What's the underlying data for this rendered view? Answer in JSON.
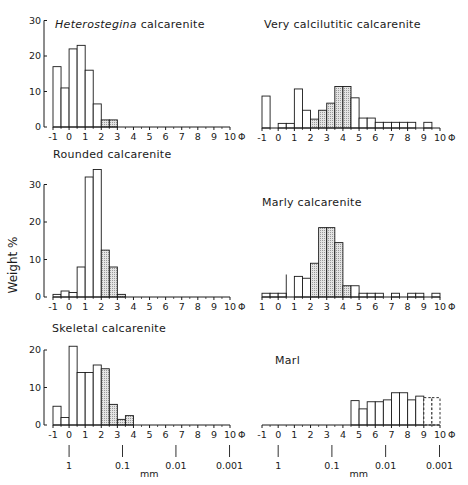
{
  "figure": {
    "ylabel": "Weight %",
    "phi_symbol": "Φ",
    "mm_label": "mm"
  },
  "chart_data": [
    {
      "type": "bar",
      "title": "Heterostegina calcarenite",
      "title_italic_word": "Heterostegina",
      "title_rest": " calcarenite",
      "xlabel": "Φ",
      "ylabel": "Weight %",
      "xticks": [
        "-1",
        "0",
        "1",
        "2",
        "3",
        "4",
        "5",
        "6",
        "7",
        "8",
        "9",
        "10"
      ],
      "yticks": [
        0,
        10,
        20,
        30
      ],
      "ylim": [
        0,
        30
      ],
      "bin_width": 0.5,
      "bins": [
        {
          "from": -1.0,
          "value": 17,
          "shaded": false
        },
        {
          "from": -0.5,
          "value": 11,
          "shaded": false
        },
        {
          "from": 0.0,
          "value": 22,
          "shaded": false
        },
        {
          "from": 0.5,
          "value": 23,
          "shaded": false
        },
        {
          "from": 1.0,
          "value": 16,
          "shaded": false
        },
        {
          "from": 1.5,
          "value": 6.5,
          "shaded": false
        },
        {
          "from": 2.0,
          "value": 2,
          "shaded": true
        },
        {
          "from": 2.5,
          "value": 2,
          "shaded": true
        }
      ]
    },
    {
      "type": "bar",
      "title": "Very calcilutitic calcarenite",
      "xlabel": "Φ",
      "xticks": [
        "-1",
        "0",
        "1",
        "2",
        "3",
        "4",
        "5",
        "6",
        "7",
        "8",
        "9",
        "10"
      ],
      "ylim": [
        0,
        30
      ],
      "bin_width": 0.5,
      "bins": [
        {
          "from": -1.0,
          "value": 9,
          "shaded": false
        },
        {
          "from": -0.5,
          "value": 0,
          "shaded": false
        },
        {
          "from": 0.0,
          "value": 1.3,
          "shaded": false
        },
        {
          "from": 0.5,
          "value": 1.3,
          "shaded": false
        },
        {
          "from": 1.0,
          "value": 11,
          "shaded": false
        },
        {
          "from": 1.5,
          "value": 5,
          "shaded": false
        },
        {
          "from": 2.0,
          "value": 2.5,
          "shaded": true
        },
        {
          "from": 2.5,
          "value": 5,
          "shaded": true
        },
        {
          "from": 3.0,
          "value": 7,
          "shaded": true
        },
        {
          "from": 3.5,
          "value": 11.7,
          "shaded": true
        },
        {
          "from": 4.0,
          "value": 11.7,
          "shaded": true
        },
        {
          "from": 4.5,
          "value": 8.5,
          "shaded": false
        },
        {
          "from": 5.0,
          "value": 2.8,
          "shaded": false
        },
        {
          "from": 5.5,
          "value": 2.8,
          "shaded": false
        },
        {
          "from": 6.0,
          "value": 1.6,
          "shaded": false
        },
        {
          "from": 6.5,
          "value": 1.6,
          "shaded": false
        },
        {
          "from": 7.0,
          "value": 1.6,
          "shaded": false
        },
        {
          "from": 7.5,
          "value": 1.6,
          "shaded": false
        },
        {
          "from": 8.0,
          "value": 1.6,
          "shaded": false
        },
        {
          "from": 8.5,
          "value": 0,
          "shaded": false
        },
        {
          "from": 9.0,
          "value": 1.6,
          "shaded": false
        }
      ]
    },
    {
      "type": "bar",
      "title": "Rounded calcarenite",
      "xlabel": "Φ",
      "xticks": [
        "-1",
        "0",
        "1",
        "2",
        "3",
        "4",
        "5",
        "6",
        "7",
        "8",
        "9",
        "10"
      ],
      "yticks": [
        0,
        10,
        20,
        30
      ],
      "ylim": [
        0,
        30
      ],
      "bin_width": 0.5,
      "bins": [
        {
          "from": -1.0,
          "value": 0.7,
          "shaded": false
        },
        {
          "from": -0.5,
          "value": 1.6,
          "shaded": false
        },
        {
          "from": 0.0,
          "value": 1.2,
          "shaded": false
        },
        {
          "from": 0.5,
          "value": 8,
          "shaded": false
        },
        {
          "from": 1.0,
          "value": 32,
          "shaded": false
        },
        {
          "from": 1.5,
          "value": 34,
          "shaded": false
        },
        {
          "from": 2.0,
          "value": 12.5,
          "shaded": true
        },
        {
          "from": 2.5,
          "value": 8,
          "shaded": true
        },
        {
          "from": 3.0,
          "value": 0.7,
          "shaded": true
        }
      ]
    },
    {
      "type": "bar",
      "title": "Marly calcarenite",
      "xlabel": "Φ",
      "xticks": [
        "1",
        "0",
        "1",
        "2",
        "3",
        "4",
        "5",
        "6",
        "7",
        "8",
        "9",
        "10"
      ],
      "ylim": [
        0,
        30
      ],
      "bin_width": 0.5,
      "annotation": "vertical line at Φ 0.5 reaching ~6%",
      "bins": [
        {
          "from": -1.0,
          "value": 1,
          "shaded": false
        },
        {
          "from": -0.5,
          "value": 1,
          "shaded": false
        },
        {
          "from": 0.0,
          "value": 1,
          "shaded": false
        },
        {
          "from": 0.5,
          "value": 0,
          "shaded": false,
          "marker_line": 6
        },
        {
          "from": 1.0,
          "value": 5.5,
          "shaded": false
        },
        {
          "from": 1.5,
          "value": 5,
          "shaded": false
        },
        {
          "from": 2.0,
          "value": 9,
          "shaded": true
        },
        {
          "from": 2.5,
          "value": 18.5,
          "shaded": true
        },
        {
          "from": 3.0,
          "value": 18.5,
          "shaded": true
        },
        {
          "from": 3.5,
          "value": 14.5,
          "shaded": true
        },
        {
          "from": 4.0,
          "value": 3,
          "shaded": true
        },
        {
          "from": 4.5,
          "value": 3,
          "shaded": false
        },
        {
          "from": 5.0,
          "value": 1,
          "shaded": false
        },
        {
          "from": 5.5,
          "value": 1,
          "shaded": false
        },
        {
          "from": 6.0,
          "value": 1,
          "shaded": false
        },
        {
          "from": 6.5,
          "value": 0,
          "shaded": false
        },
        {
          "from": 7.0,
          "value": 1,
          "shaded": false
        },
        {
          "from": 7.5,
          "value": 0,
          "shaded": false
        },
        {
          "from": 8.0,
          "value": 1,
          "shaded": false
        },
        {
          "from": 8.5,
          "value": 1,
          "shaded": false
        },
        {
          "from": 9.0,
          "value": 0,
          "shaded": false
        },
        {
          "from": 9.5,
          "value": 1,
          "shaded": false
        }
      ]
    },
    {
      "type": "bar",
      "title": "Skeletal calcarenite",
      "xlabel": "Φ",
      "xticks": [
        "-1",
        "0",
        "1",
        "2",
        "3",
        "4",
        "5",
        "6",
        "7",
        "8",
        "9",
        "10"
      ],
      "yticks": [
        0,
        10,
        20
      ],
      "ylim": [
        0,
        20
      ],
      "bin_width": 0.5,
      "mm_ticks": [
        {
          "phi": 0,
          "label": "1"
        },
        {
          "phi": 3.32,
          "label": "0.1"
        },
        {
          "phi": 6.64,
          "label": "0.01"
        },
        {
          "phi": 9.97,
          "label": "0.001"
        }
      ],
      "bins": [
        {
          "from": -1.0,
          "value": 5,
          "shaded": false
        },
        {
          "from": -0.5,
          "value": 2,
          "shaded": false
        },
        {
          "from": 0.0,
          "value": 21,
          "shaded": false
        },
        {
          "from": 0.5,
          "value": 14,
          "shaded": false
        },
        {
          "from": 1.0,
          "value": 14,
          "shaded": false
        },
        {
          "from": 1.5,
          "value": 16,
          "shaded": false
        },
        {
          "from": 2.0,
          "value": 15,
          "shaded": true
        },
        {
          "from": 2.5,
          "value": 5.5,
          "shaded": true
        },
        {
          "from": 3.0,
          "value": 1.5,
          "shaded": true
        },
        {
          "from": 3.5,
          "value": 2.5,
          "shaded": true
        }
      ]
    },
    {
      "type": "bar",
      "title": "Marl",
      "xlabel": "Φ",
      "xticks": [
        "-1",
        "0",
        "1",
        "2",
        "3",
        "4",
        "5",
        "6",
        "7",
        "8",
        "9",
        "10"
      ],
      "ylim": [
        0,
        20
      ],
      "bin_width": 0.5,
      "mm_ticks": [
        {
          "phi": 0,
          "label": "1"
        },
        {
          "phi": 3.32,
          "label": "0.1"
        },
        {
          "phi": 6.64,
          "label": "0.01"
        },
        {
          "phi": 9.97,
          "label": "0.001"
        }
      ],
      "bins": [
        {
          "from": 4.5,
          "value": 6.5,
          "shaded": false
        },
        {
          "from": 5.0,
          "value": 4.3,
          "shaded": false
        },
        {
          "from": 5.5,
          "value": 6.2,
          "shaded": false
        },
        {
          "from": 6.0,
          "value": 6.2,
          "shaded": false
        },
        {
          "from": 6.5,
          "value": 6.7,
          "shaded": false
        },
        {
          "from": 7.0,
          "value": 8.6,
          "shaded": false
        },
        {
          "from": 7.5,
          "value": 8.6,
          "shaded": false
        },
        {
          "from": 8.0,
          "value": 6.7,
          "shaded": false
        },
        {
          "from": 8.5,
          "value": 7.7,
          "shaded": false
        },
        {
          "from": 9.0,
          "value": 7.3,
          "shaded": false,
          "dashed": true
        },
        {
          "from": 9.5,
          "value": 7.3,
          "shaded": false,
          "dashed": true
        }
      ]
    }
  ]
}
